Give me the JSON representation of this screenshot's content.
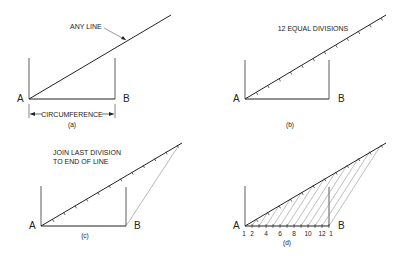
{
  "panels": [
    {
      "id": "a",
      "caption": "(a)",
      "point_a": "A",
      "point_b": "B",
      "annotation": "ANY LINE",
      "dimension_label": "CIRCUMFERENCE"
    },
    {
      "id": "b",
      "caption": "(b)",
      "point_a": "A",
      "point_b": "B",
      "annotation": "12 EQUAL DIVISIONS",
      "divisions": 12
    },
    {
      "id": "c",
      "caption": "(c)",
      "point_a": "A",
      "point_b": "B",
      "annotation_line1": "JOIN LAST DIVISION",
      "annotation_line2": "TO END OF LINE"
    },
    {
      "id": "d",
      "caption": "(d)",
      "point_a": "A",
      "point_b": "B",
      "scale_labels": [
        "1",
        "2",
        "4",
        "6",
        "8",
        "10",
        "12",
        "1"
      ]
    }
  ],
  "colors": {
    "line": "#222222",
    "construction": "#888888"
  }
}
